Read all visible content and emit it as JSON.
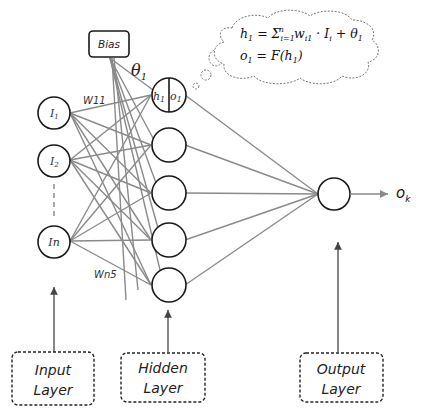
{
  "input_layer": {
    "nodes": [
      {
        "label": "I",
        "sub": "1"
      },
      {
        "label": "I",
        "sub": "2"
      },
      {
        "label": "In",
        "sub": ""
      }
    ],
    "box_line1": "Input",
    "box_line2": "Layer"
  },
  "hidden_layer": {
    "first_node": {
      "left": "h",
      "left_sub": "1",
      "right": "o",
      "right_sub": "1"
    },
    "node_count": 5,
    "box_line1": "Hidden",
    "box_line2": "Layer"
  },
  "output_layer": {
    "output_label": "o",
    "output_sub": "k",
    "box_line1": "Output",
    "box_line2": "Layer"
  },
  "bias": {
    "label": "Bias",
    "theta": "θ",
    "theta_sub": "1"
  },
  "weights": {
    "w11": "W11",
    "wn5": "Wn5"
  },
  "equations": {
    "eq1": {
      "lhs": "h",
      "lhs_sub": "1",
      "eq": " = Σ",
      "sum_sub": "i=1",
      "sum_sup": "n",
      "term": "w",
      "term_sub": "i1",
      "dot": " · I",
      "i_sub": "i",
      "plus": " + θ",
      "theta_sub": "1"
    },
    "eq2": {
      "lhs": "o",
      "lhs_sub": "1",
      "rhs": " = F(h",
      "rhs_sub": "1",
      "close": ")"
    }
  },
  "colors": {
    "edge": "#8a8a8a",
    "node_stroke": "#1a1a1a",
    "background": "#ffffff"
  }
}
